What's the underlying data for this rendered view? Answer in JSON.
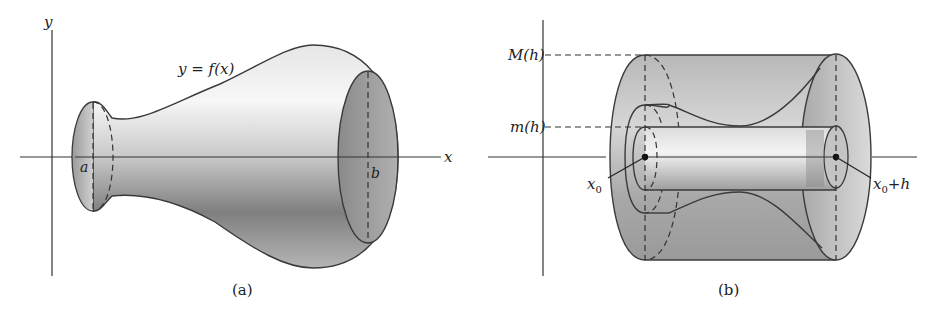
{
  "figure_a": {
    "caption": "(a)",
    "x_axis_label": "x",
    "y_axis_label": "y",
    "curve_label": "y = f(x)",
    "left_endpoint_label": "a",
    "right_endpoint_label": "b",
    "description": "Solid of revolution generated by rotating y = f(x) about the x-axis between x = a and x = b"
  },
  "figure_b": {
    "caption": "(b)",
    "max_label": "M(h)",
    "min_label": "m(h)",
    "left_point_label": "x",
    "left_point_subscript": "0",
    "right_point_label_main": "x",
    "right_point_subscript": "0",
    "right_point_suffix": "+h",
    "description": "Slice of the solid between x0 and x0+h bounded by inner cylinder of radius m(h) and outer cylinder of radius M(h)"
  },
  "colors": {
    "background": "#ffffff",
    "outline": "#3a3a3a",
    "shade_light": "#f2f2f2",
    "shade_mid": "#bdbdbd",
    "shade_dark": "#7a7a7a"
  }
}
